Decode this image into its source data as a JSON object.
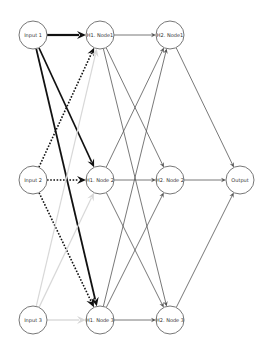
{
  "diagram": {
    "type": "neural-network",
    "layers": [
      {
        "name": "input",
        "nodes": [
          {
            "id": "in1",
            "label": "Input 1",
            "x": 33,
            "y": 35
          },
          {
            "id": "in2",
            "label": "Input 2",
            "x": 33,
            "y": 180
          },
          {
            "id": "in3",
            "label": "Input 3",
            "x": 33,
            "y": 320
          }
        ]
      },
      {
        "name": "hidden1",
        "nodes": [
          {
            "id": "h1n1",
            "label": "H1. Node1",
            "x": 100,
            "y": 35
          },
          {
            "id": "h1n2",
            "label": "H1. Node 2",
            "x": 100,
            "y": 180
          },
          {
            "id": "h1n3",
            "label": "H1. Node 3",
            "x": 100,
            "y": 320
          }
        ]
      },
      {
        "name": "hidden2",
        "nodes": [
          {
            "id": "h2n1",
            "label": "H2. Node1",
            "x": 170,
            "y": 35
          },
          {
            "id": "h2n2",
            "label": "H2. Node 2",
            "x": 170,
            "y": 180
          },
          {
            "id": "h2n3",
            "label": "H2. Node 3",
            "x": 170,
            "y": 320
          }
        ]
      },
      {
        "name": "output",
        "nodes": [
          {
            "id": "out",
            "label": "Output",
            "x": 240,
            "y": 180
          }
        ]
      }
    ],
    "node_radius": 14,
    "colors": {
      "strong": "#111111",
      "medium": "#555555",
      "light": "#d8d8d8",
      "node_stroke": "#777777"
    },
    "edges": [
      {
        "from": "in1",
        "to": "h1n1",
        "style": "solid",
        "weight": "strong",
        "width": 2.2,
        "head": 9
      },
      {
        "from": "in1",
        "to": "h1n2",
        "style": "solid",
        "weight": "strong",
        "width": 1.6,
        "head": 8
      },
      {
        "from": "in1",
        "to": "h1n3",
        "style": "solid",
        "weight": "strong",
        "width": 1.8,
        "head": 9
      },
      {
        "from": "in2",
        "to": "h1n1",
        "style": "dotted",
        "weight": "strong",
        "width": 1.6,
        "head": 8
      },
      {
        "from": "in2",
        "to": "h1n2",
        "style": "dotted",
        "weight": "strong",
        "width": 1.6,
        "head": 9
      },
      {
        "from": "in2",
        "to": "h1n3",
        "style": "dotted",
        "weight": "strong",
        "width": 1.6,
        "head": 9
      },
      {
        "from": "in3",
        "to": "h1n1",
        "style": "solid",
        "weight": "light",
        "width": 1.2,
        "head": 8
      },
      {
        "from": "in3",
        "to": "h1n2",
        "style": "solid",
        "weight": "light",
        "width": 1.2,
        "head": 8
      },
      {
        "from": "in3",
        "to": "h1n3",
        "style": "solid",
        "weight": "light",
        "width": 1.4,
        "head": 9
      },
      {
        "from": "h1n1",
        "to": "h2n1",
        "style": "solid",
        "weight": "medium",
        "width": 0.8,
        "head": 5
      },
      {
        "from": "h1n1",
        "to": "h2n2",
        "style": "solid",
        "weight": "medium",
        "width": 0.8,
        "head": 5
      },
      {
        "from": "h1n1",
        "to": "h2n3",
        "style": "solid",
        "weight": "medium",
        "width": 0.8,
        "head": 5
      },
      {
        "from": "h1n2",
        "to": "h2n1",
        "style": "solid",
        "weight": "medium",
        "width": 0.8,
        "head": 5
      },
      {
        "from": "h1n2",
        "to": "h2n2",
        "style": "solid",
        "weight": "medium",
        "width": 0.8,
        "head": 5
      },
      {
        "from": "h1n2",
        "to": "h2n3",
        "style": "solid",
        "weight": "medium",
        "width": 0.8,
        "head": 5
      },
      {
        "from": "h1n3",
        "to": "h2n1",
        "style": "solid",
        "weight": "medium",
        "width": 0.8,
        "head": 5
      },
      {
        "from": "h1n3",
        "to": "h2n2",
        "style": "solid",
        "weight": "medium",
        "width": 0.8,
        "head": 5
      },
      {
        "from": "h1n3",
        "to": "h2n3",
        "style": "solid",
        "weight": "medium",
        "width": 0.8,
        "head": 5
      },
      {
        "from": "h2n1",
        "to": "out",
        "style": "solid",
        "weight": "medium",
        "width": 0.8,
        "head": 5
      },
      {
        "from": "h2n2",
        "to": "out",
        "style": "solid",
        "weight": "medium",
        "width": 0.8,
        "head": 5
      },
      {
        "from": "h2n3",
        "to": "out",
        "style": "solid",
        "weight": "medium",
        "width": 0.8,
        "head": 5
      }
    ]
  }
}
